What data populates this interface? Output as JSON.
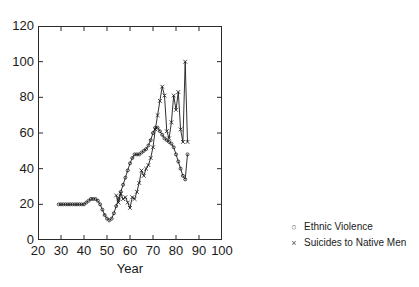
{
  "chart_data": {
    "type": "line",
    "title": "",
    "subtitle": "",
    "xlabel": "Year",
    "ylabel": "",
    "xlim": [
      20,
      100
    ],
    "ylim": [
      0,
      120
    ],
    "xticks": [
      20,
      30,
      40,
      50,
      60,
      70,
      80,
      90,
      100
    ],
    "yticks": [
      0,
      20,
      40,
      60,
      80,
      100,
      120
    ],
    "grid": false,
    "legend_position": "right-outside",
    "series": [
      {
        "name": "Ethnic Violence",
        "marker": "circle",
        "marker_symbol": "○",
        "color": "#1a1a1a",
        "x": [
          29,
          30,
          31,
          32,
          33,
          34,
          35,
          36,
          37,
          38,
          39,
          40,
          41,
          42,
          43,
          44,
          45,
          46,
          47,
          48,
          49,
          50,
          51,
          52,
          53,
          54,
          55,
          56,
          57,
          58,
          59,
          60,
          61,
          62,
          63,
          64,
          65,
          66,
          67,
          68,
          69,
          70,
          71,
          72,
          73,
          74,
          75,
          76,
          77,
          78,
          79,
          80,
          81,
          82,
          83,
          84,
          85
        ],
        "y": [
          20,
          20,
          20,
          20,
          20,
          20,
          20,
          20,
          20,
          20,
          20,
          20,
          21,
          22,
          23,
          23,
          23,
          22,
          20,
          17,
          14,
          12,
          11,
          12,
          15,
          19,
          23,
          27,
          31,
          35,
          39,
          43,
          46,
          48,
          48,
          48,
          49,
          50,
          51,
          53,
          56,
          60,
          63,
          63,
          61,
          59,
          57,
          56,
          55,
          54,
          52,
          48,
          44,
          40,
          36,
          34,
          48
        ]
      },
      {
        "name": "Suicides to Native Men",
        "marker": "x",
        "marker_symbol": "×",
        "color": "#1a1a1a",
        "x": [
          54,
          55,
          56,
          57,
          58,
          59,
          60,
          61,
          62,
          63,
          64,
          65,
          66,
          67,
          68,
          69,
          70,
          71,
          72,
          73,
          74,
          75,
          76,
          77,
          78,
          79,
          80,
          81,
          82,
          83,
          84,
          85
        ],
        "y": [
          25,
          21,
          26,
          23,
          24,
          21,
          18,
          24,
          23,
          27,
          32,
          39,
          36,
          40,
          42,
          46,
          52,
          62,
          70,
          78,
          86,
          81,
          61,
          57,
          66,
          81,
          73,
          83,
          62,
          55,
          100,
          55
        ]
      }
    ]
  },
  "legend": {
    "items": [
      {
        "marker": "○",
        "label": "Ethnic Violence"
      },
      {
        "marker": "×",
        "label": "Suicides to Native Men"
      }
    ]
  },
  "axis": {
    "xlabel": "Year",
    "ytick_labels": [
      "120",
      "100",
      "80",
      "60",
      "40",
      "20",
      "0"
    ],
    "xtick_labels": [
      "20",
      "30",
      "40",
      "50",
      "60",
      "70",
      "80",
      "90",
      "100"
    ]
  }
}
